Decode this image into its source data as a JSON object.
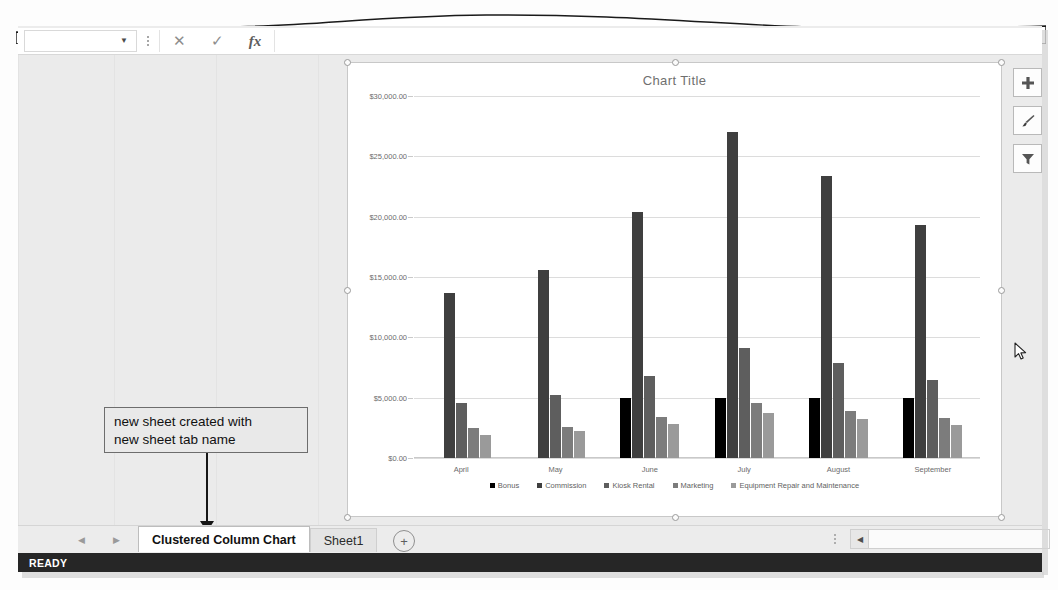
{
  "app": {
    "status_text": "READY"
  },
  "formula_bar": {
    "name_box_value": "",
    "name_box_caret": "▼",
    "cancel_label": "✕",
    "enter_label": "✓",
    "fx_label": "fx",
    "formula_value": ""
  },
  "chart_buttons": [
    {
      "name": "chart-elements",
      "glyph": "✚"
    },
    {
      "name": "chart-styles",
      "glyph": "🖌"
    },
    {
      "name": "chart-filters",
      "glyph": "▼"
    }
  ],
  "annotation": {
    "line1": "new sheet created with",
    "line2": "new sheet tab name"
  },
  "tab_bar": {
    "prev_arrow": "◀",
    "next_arrow": "▶",
    "new_sheet_label": "+",
    "tabs": [
      {
        "label": "Clustered Column Chart",
        "active": true
      },
      {
        "label": "Sheet1",
        "active": false
      }
    ],
    "scroll_left_arrow": "◀"
  },
  "chart_data": {
    "type": "bar",
    "title": "Chart Title",
    "xlabel": "",
    "ylabel": "",
    "ylim": [
      0,
      30000
    ],
    "ytick_labels": [
      "$0.00",
      "$5,000.00",
      "$10,000.00",
      "$15,000.00",
      "$20,000.00",
      "$25,000.00",
      "$30,000.00"
    ],
    "ytick_values": [
      0,
      5000,
      10000,
      15000,
      20000,
      25000,
      30000
    ],
    "grid": true,
    "legend_position": "bottom",
    "categories": [
      "April",
      "May",
      "June",
      "July",
      "August",
      "September"
    ],
    "series": [
      {
        "name": "Bonus",
        "color": "#000000",
        "values": [
          0,
          0,
          5000,
          5000,
          5000,
          5000
        ]
      },
      {
        "name": "Commission",
        "color": "#3f3f3f",
        "values": [
          13700,
          15600,
          20400,
          27000,
          23400,
          19300
        ]
      },
      {
        "name": "Kiosk Rental",
        "color": "#5e5e5e",
        "values": [
          4600,
          5200,
          6800,
          9100,
          7900,
          6500
        ]
      },
      {
        "name": "Marketing",
        "color": "#7c7c7c",
        "values": [
          2500,
          2600,
          3400,
          4600,
          3900,
          3300
        ]
      },
      {
        "name": "Equipment Repair and Maintenance",
        "color": "#9a9a9a",
        "values": [
          1900,
          2200,
          2800,
          3700,
          3200,
          2700
        ]
      }
    ]
  }
}
